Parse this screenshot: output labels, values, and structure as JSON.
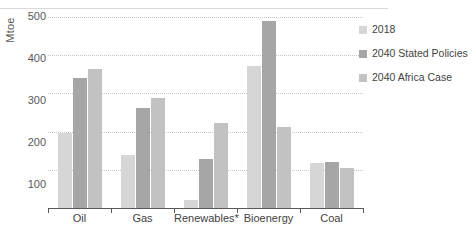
{
  "chart_data": {
    "type": "bar",
    "title": "",
    "xlabel": "",
    "ylabel": "Mtoe",
    "ylim": [
      0,
      500
    ],
    "yticks": [
      100,
      200,
      300,
      400,
      500
    ],
    "grid": true,
    "legend_position": "right",
    "categories": [
      "Oil",
      "Gas",
      "Renewables*",
      "Bioenergy",
      "Coal"
    ],
    "series": [
      {
        "name": "2018",
        "color": "#d6d6d6",
        "values": [
          196,
          138,
          20,
          372,
          117
        ]
      },
      {
        "name": "2040 Stated Policies",
        "color": "#a6a6a6",
        "values": [
          340,
          262,
          128,
          490,
          120
        ]
      },
      {
        "name": "2040 Africa Case",
        "color": "#c2c2c2",
        "values": [
          364,
          288,
          222,
          212,
          104
        ]
      }
    ]
  },
  "axis": {
    "y_label": "Mtoe",
    "y_ticks": [
      "500",
      "400",
      "300",
      "200",
      "100"
    ],
    "x_ticks": [
      "Oil",
      "Gas",
      "Renewables*",
      "Bioenergy",
      "Coal"
    ]
  },
  "legend": {
    "items": [
      {
        "label": "2018",
        "color": "#d6d6d6"
      },
      {
        "label": "2040 Stated Policies",
        "color": "#a6a6a6"
      },
      {
        "label": "2040 Africa Case",
        "color": "#c2c2c2"
      }
    ]
  },
  "header": {
    "ghost_title": ""
  }
}
